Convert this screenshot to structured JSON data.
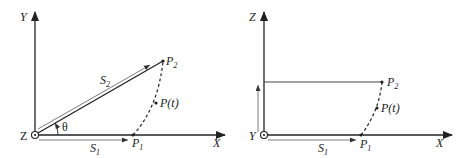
{
  "left_panel": {
    "axes": {
      "vertical": "Y",
      "horizontal": "X",
      "out_of_page": "Z"
    },
    "angle_label": "θ",
    "vectors": [
      {
        "name": "S",
        "sub": "2"
      },
      {
        "name": "S",
        "sub": "1"
      }
    ],
    "points": [
      {
        "name": "P",
        "sub": "2"
      },
      {
        "name": "P",
        "sub": "1"
      },
      {
        "name": "P(t)",
        "sub": ""
      }
    ]
  },
  "right_panel": {
    "axes": {
      "vertical": "Z",
      "horizontal": "X",
      "out_of_page": "Y"
    },
    "vectors": [
      {
        "name": "S",
        "sub": "1"
      }
    ],
    "points": [
      {
        "name": "P",
        "sub": "2"
      },
      {
        "name": "P",
        "sub": "1"
      },
      {
        "name": "P(t)",
        "sub": ""
      }
    ]
  },
  "colors": {
    "stroke": "#222222",
    "light_stroke": "#555555"
  }
}
